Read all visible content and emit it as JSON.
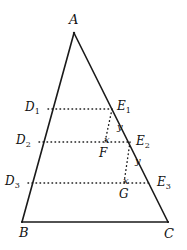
{
  "figure": {
    "kind": "geometry-diagram",
    "stroke_color": "#1a1a1a",
    "dotted_color": "#1a1a1a",
    "background": "#ffffff"
  },
  "vertices": {
    "A": {
      "label": "A",
      "x": 74,
      "y": 33,
      "label_x": 69,
      "label_y": 13
    },
    "B": {
      "label": "B",
      "x": 22,
      "y": 222,
      "label_x": 19,
      "label_y": 226
    },
    "C": {
      "label": "C",
      "x": 168,
      "y": 222,
      "label_x": 164,
      "label_y": 227
    }
  },
  "left_points": [
    {
      "label": "D",
      "sub": "1",
      "x": 48,
      "y": 109,
      "label_x": 25,
      "label_y": 101
    },
    {
      "label": "D",
      "sub": "2",
      "x": 39,
      "y": 142,
      "label_x": 16,
      "label_y": 134
    },
    {
      "label": "D",
      "sub": "3",
      "x": 28,
      "y": 183,
      "label_x": 5,
      "label_y": 175
    }
  ],
  "right_points": [
    {
      "label": "E",
      "sub": "1",
      "x": 112,
      "y": 109,
      "label_x": 117,
      "label_y": 100
    },
    {
      "label": "E",
      "sub": "2",
      "x": 130,
      "y": 142,
      "label_x": 136,
      "label_y": 135
    },
    {
      "label": "E",
      "sub": "3",
      "x": 152,
      "y": 183,
      "label_x": 157,
      "label_y": 176
    }
  ],
  "foot_points": [
    {
      "label": "F",
      "x": 105,
      "y": 142,
      "label_x": 99,
      "label_y": 147
    },
    {
      "label": "G",
      "x": 124,
      "y": 183,
      "label_x": 119,
      "label_y": 188
    }
  ],
  "segment_labels": [
    {
      "label": "y",
      "x": 117,
      "y": 122,
      "for": "E1-F-vertical-upper"
    },
    {
      "label": "x",
      "x": 104,
      "y": 135,
      "for": "D2E2-row-left-of-E1-foot"
    },
    {
      "label": "y",
      "x": 135,
      "y": 156,
      "for": "E2-G-vertical-upper"
    },
    {
      "label": "x",
      "x": 123,
      "y": 176,
      "for": "D3E3-row-left-of-E2-foot"
    }
  ],
  "dotted_rows": [
    {
      "name": "D1E1",
      "x1": 48,
      "y1": 109,
      "x2": 112,
      "y2": 109
    },
    {
      "name": "D2E2",
      "x1": 39,
      "y1": 142,
      "x2": 130,
      "y2": 142
    },
    {
      "name": "D3E3",
      "x1": 28,
      "y1": 183,
      "x2": 152,
      "y2": 183
    }
  ],
  "dotted_verticals": [
    {
      "name": "E1-to-F",
      "x1": 112,
      "y1": 109,
      "x2": 105,
      "y2": 142
    },
    {
      "name": "E2-to-G",
      "x1": 130,
      "y1": 142,
      "x2": 124,
      "y2": 183
    }
  ]
}
